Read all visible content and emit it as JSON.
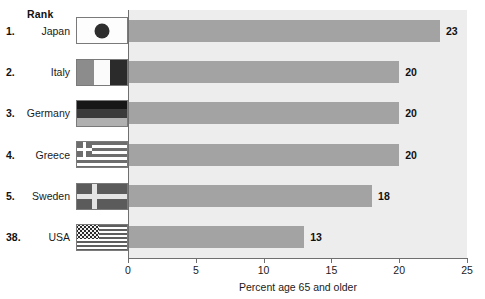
{
  "table": {
    "rank_header": "Rank",
    "rows": [
      {
        "rank": "1.",
        "country": "Japan",
        "flag": "flag-japan",
        "value": 23,
        "value_label": "23"
      },
      {
        "rank": "2.",
        "country": "Italy",
        "flag": "flag-italy",
        "value": 20,
        "value_label": "20"
      },
      {
        "rank": "3.",
        "country": "Germany",
        "flag": "flag-germany",
        "value": 20,
        "value_label": "20"
      },
      {
        "rank": "4.",
        "country": "Greece",
        "flag": "flag-greece",
        "value": 20,
        "value_label": "20"
      },
      {
        "rank": "5.",
        "country": "Sweden",
        "flag": "flag-sweden",
        "value": 18,
        "value_label": "18"
      },
      {
        "rank": "38.",
        "country": "USA",
        "flag": "flag-usa",
        "value": 13,
        "value_label": "13"
      }
    ]
  },
  "axis": {
    "title": "Percent age 65 and older",
    "ticks": [
      "0",
      "5",
      "10",
      "15",
      "20",
      "25"
    ]
  },
  "colors": {
    "bar": "#a3a3a3",
    "plot_background": "#ededed",
    "axis": "#6f6f6f",
    "text": "#1a1a1a"
  },
  "chart_data": {
    "type": "bar",
    "orientation": "horizontal",
    "title": "",
    "xlabel": "Percent age 65 and older",
    "ylabel": "",
    "categories": [
      "Japan",
      "Italy",
      "Germany",
      "Greece",
      "Sweden",
      "USA"
    ],
    "values": [
      23,
      20,
      20,
      20,
      18,
      13
    ],
    "data_labels": [
      "23",
      "20",
      "20",
      "20",
      "18",
      "13"
    ],
    "ranks": [
      "1.",
      "2.",
      "3.",
      "4.",
      "5.",
      "38."
    ],
    "xlim": [
      0,
      25
    ],
    "xticks": [
      0,
      5,
      10,
      15,
      20,
      25
    ],
    "grid": false,
    "legend": false
  }
}
